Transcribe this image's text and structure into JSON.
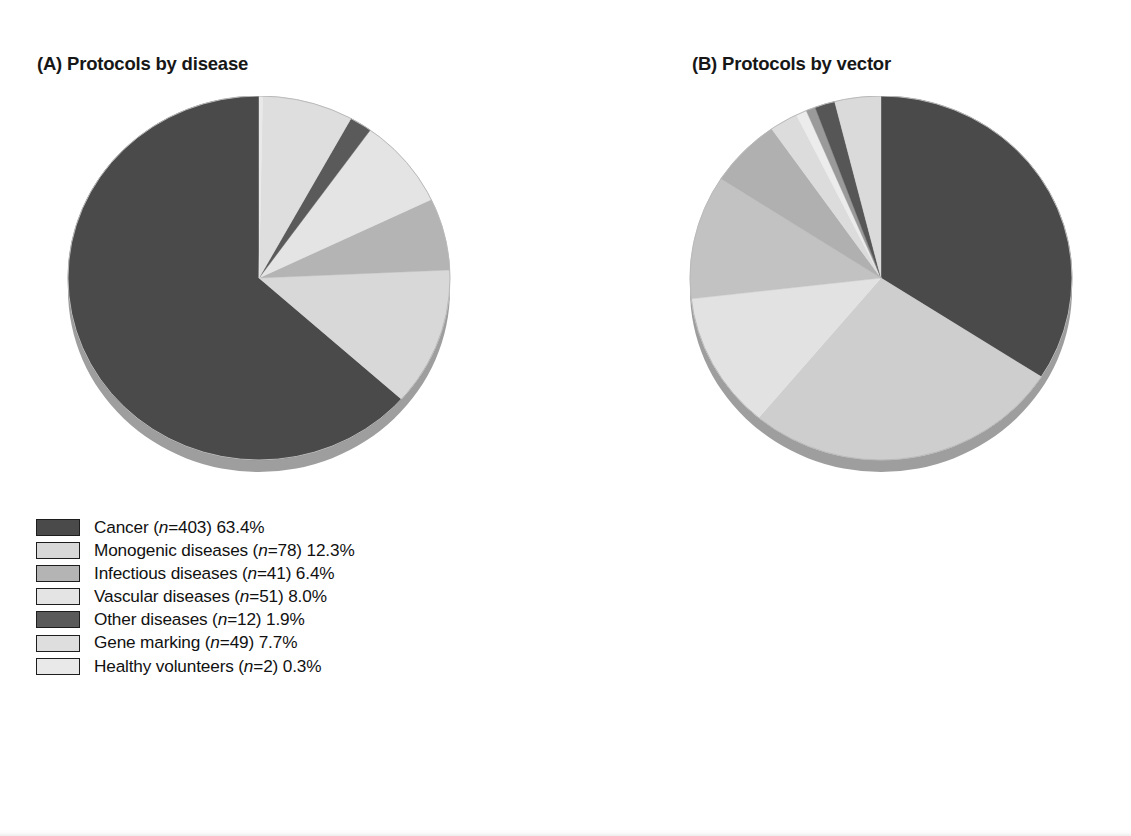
{
  "figure": {
    "background": "#ffffff",
    "panels": [
      {
        "id": "A",
        "title": "(A) Protocols by disease"
      },
      {
        "id": "B",
        "title": "(B) Protocols by vector"
      }
    ]
  },
  "panel_a": {
    "title": "(A) Protocols by disease",
    "legend": [
      {
        "label": "Cancer (n=403) 63.4%",
        "name": "Cancer",
        "n": 403,
        "percent": 63.4,
        "color": "#4a4a4a"
      },
      {
        "label": "Monogenic diseases (n=78) 12.3%",
        "name": "Monogenic diseases",
        "n": 78,
        "percent": 12.3,
        "color": "#d8d8d8"
      },
      {
        "label": "Infectious diseases (n=41) 6.4%",
        "name": "Infectious diseases",
        "n": 41,
        "percent": 6.4,
        "color": "#b4b4b4"
      },
      {
        "label": "Vascular diseases (n=51) 8.0%",
        "name": "Vascular diseases",
        "n": 51,
        "percent": 8.0,
        "color": "#e4e4e4"
      },
      {
        "label": "Other diseases (n=12) 1.9%",
        "name": "Other diseases",
        "n": 12,
        "percent": 1.9,
        "color": "#5a5a5a"
      },
      {
        "label": "Gene marking (n=49) 7.7%",
        "name": "Gene marking",
        "n": 49,
        "percent": 7.7,
        "color": "#dedede"
      },
      {
        "label": "Healthy volunteers (n=2) 0.3%",
        "name": "Healthy volunteers",
        "n": 2,
        "percent": 0.3,
        "color": "#e9e9e9"
      }
    ]
  },
  "panel_b": {
    "title": "(B) Protocols by vector",
    "legend": [
      {
        "label": "Retrovirus (n=217) 34.1%",
        "name": "Retrovirus",
        "n": 217,
        "percent": 34.1,
        "color": "#4a4a4a"
      },
      {
        "label": "Adenovirus (n=171) 26.9%",
        "name": "Adenovirus",
        "n": 171,
        "percent": 26.9,
        "color": "#cecece"
      },
      {
        "label": "Lipofection (n=77) 12.1%",
        "name": "Lipofection",
        "n": 77,
        "percent": 12.1,
        "color": "#e2e2e2"
      },
      {
        "label": "Naked/plasmid DNA (n=70) 11.0%",
        "name": "Naked/plasmid DNA",
        "n": 70,
        "percent": 11.0,
        "color": "#c2c2c2"
      },
      {
        "label": "Pox virus (n=39) 6.1%",
        "name": "Pox virus",
        "n": 39,
        "percent": 6.1,
        "color": "#b0b0b0"
      },
      {
        "label": "Adeno-associated virus (n=15) 2.4%",
        "name": "Adeno-associated virus",
        "n": 15,
        "percent": 2.4,
        "color": "#dcdcdc"
      },
      {
        "label": "RNA transfer (n=6) 0.9%",
        "name": "RNA transfer",
        "n": 6,
        "percent": 0.9,
        "color": "#ececec"
      },
      {
        "label": "Herpes simplex virus (n=5) 0.8%",
        "name": "Herpes simplex virus",
        "n": 5,
        "percent": 0.8,
        "color": "#9a9a9a"
      },
      {
        "label": "Others (n=11) 1.7%",
        "name": "Others",
        "n": 11,
        "percent": 1.7,
        "color": "#565656"
      },
      {
        "label": "N/C (n=25) 3.9%",
        "name": "N/C",
        "n": 25,
        "percent": 3.9,
        "color": "#dadada"
      }
    ]
  },
  "chart_data": [
    {
      "type": "pie",
      "id": "protocols-by-disease",
      "title": "(A) Protocols by disease",
      "total_n": 636,
      "start_angle_deg": 0,
      "direction": "counterclockwise",
      "style": "3d-elliptical",
      "legend_position": "below",
      "labels": [
        "Cancer",
        "Monogenic diseases",
        "Infectious diseases",
        "Vascular diseases",
        "Other diseases",
        "Gene marking",
        "Healthy volunteers"
      ],
      "values": [
        403,
        78,
        41,
        51,
        12,
        49,
        2
      ],
      "percents": [
        63.4,
        12.3,
        6.4,
        8.0,
        1.9,
        7.7,
        0.3
      ],
      "colors": [
        "#4a4a4a",
        "#d8d8d8",
        "#b4b4b4",
        "#e4e4e4",
        "#5a5a5a",
        "#dedede",
        "#e9e9e9"
      ]
    },
    {
      "type": "pie",
      "id": "protocols-by-vector",
      "title": "(B) Protocols by vector",
      "total_n": 636,
      "start_angle_deg": 0,
      "direction": "clockwise",
      "style": "3d-elliptical",
      "legend_position": "below",
      "labels": [
        "Retrovirus",
        "Adenovirus",
        "Lipofection",
        "Naked/plasmid DNA",
        "Pox virus",
        "Adeno-associated virus",
        "RNA transfer",
        "Herpes simplex virus",
        "Others",
        "N/C"
      ],
      "values": [
        217,
        171,
        77,
        70,
        39,
        15,
        6,
        5,
        11,
        25
      ],
      "percents": [
        34.1,
        26.9,
        12.1,
        11.0,
        6.1,
        2.4,
        0.9,
        0.8,
        1.7,
        3.9
      ],
      "colors": [
        "#4a4a4a",
        "#cecece",
        "#e2e2e2",
        "#c2c2c2",
        "#b0b0b0",
        "#dcdcdc",
        "#ececec",
        "#9a9a9a",
        "#565656",
        "#dadada"
      ]
    }
  ]
}
